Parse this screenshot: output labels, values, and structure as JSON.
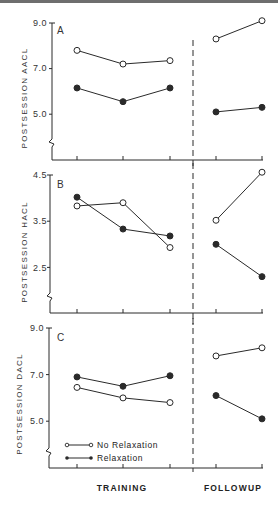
{
  "chart_data": [
    {
      "type": "line",
      "panel": "A",
      "ylabel": "POSTSESSION AACL",
      "yticks": [
        "9.0",
        "7.0",
        "5.0"
      ],
      "ylim": [
        4.0,
        9.0
      ],
      "x": [
        "Training 1",
        "Training 2",
        "Training 3",
        "Followup 1",
        "Followup 2"
      ],
      "series": [
        {
          "name": "No Relaxation",
          "marker": "open",
          "values": [
            7.8,
            7.2,
            7.35,
            8.3,
            9.1
          ]
        },
        {
          "name": "Relaxation",
          "marker": "filled",
          "values": [
            6.15,
            5.55,
            6.15,
            5.1,
            5.3
          ]
        }
      ]
    },
    {
      "type": "line",
      "panel": "B",
      "ylabel": "POSTSESSION HACL",
      "yticks": [
        "4.5",
        "3.5",
        "2.5"
      ],
      "ylim": [
        2.0,
        4.5
      ],
      "x": [
        "Training 1",
        "Training 2",
        "Training 3",
        "Followup 1",
        "Followup 2"
      ],
      "series": [
        {
          "name": "No Relaxation",
          "marker": "open",
          "values": [
            3.83,
            3.9,
            2.93,
            3.52,
            4.56
          ]
        },
        {
          "name": "Relaxation",
          "marker": "filled",
          "values": [
            4.02,
            3.33,
            3.18,
            3.0,
            2.3
          ]
        }
      ]
    },
    {
      "type": "line",
      "panel": "C",
      "ylabel": "POSTSESSION DACL",
      "yticks": [
        "9.0",
        "7.0",
        "5.0"
      ],
      "ylim": [
        4.0,
        9.0
      ],
      "x": [
        "Training 1",
        "Training 2",
        "Training 3",
        "Followup 1",
        "Followup 2"
      ],
      "series": [
        {
          "name": "No Relaxation",
          "marker": "open",
          "values": [
            6.45,
            6.0,
            5.8,
            7.8,
            8.15
          ]
        },
        {
          "name": "Relaxation",
          "marker": "filled",
          "values": [
            6.9,
            6.5,
            6.95,
            6.1,
            5.1
          ]
        }
      ]
    }
  ],
  "legend": {
    "no_relaxation": "No Relaxation",
    "relaxation": "Relaxation"
  },
  "xaxis": {
    "training": "TRAINING",
    "followup": "FOLLOWUP"
  },
  "colors": {
    "ink": "#2a2a2a",
    "background": "#ffffff"
  }
}
